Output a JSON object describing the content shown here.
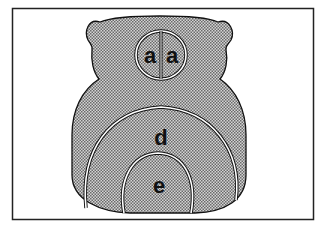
{
  "figure": {
    "colors": {
      "background": "#ffffff",
      "frame": "#222222",
      "fill_dots": "#555555",
      "fill_base": "#c8c8c8",
      "outline": "#111111",
      "label": "#111111"
    },
    "labels": {
      "a_left": "a",
      "a_right": "a",
      "d": "d",
      "e": "e"
    }
  }
}
